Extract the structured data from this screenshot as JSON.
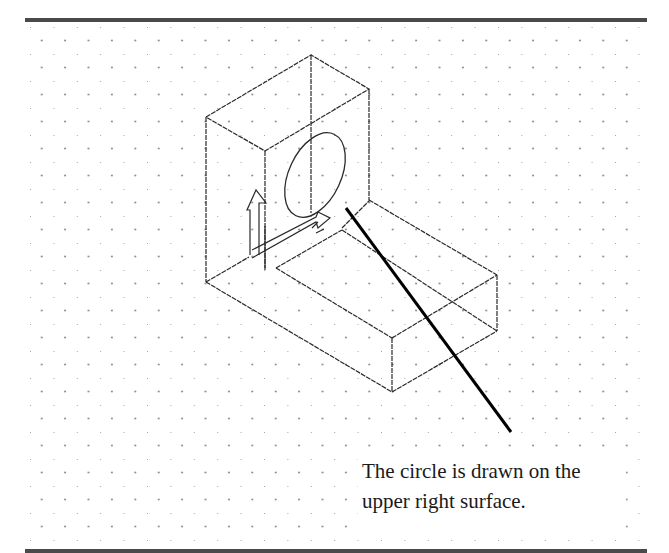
{
  "diagram": {
    "type": "isometric-cad-drawing",
    "background": "isometric-dot-grid",
    "colors": {
      "line": "#2a2a2a",
      "leader": "#000000",
      "dot": "#7a7a7a",
      "rule": "#4a4a4a"
    },
    "objects": [
      {
        "name": "upright-block",
        "description": "tall rectangular block (back)"
      },
      {
        "name": "base-block",
        "description": "low rectangular block (front right)"
      },
      {
        "name": "circle",
        "description": "isometric circle on upper right surface"
      },
      {
        "name": "ucs-icon",
        "description": "UCS arrows icon at inner corner"
      }
    ],
    "callout": {
      "line1": "The circle is drawn on the",
      "line2": "upper right surface."
    }
  }
}
